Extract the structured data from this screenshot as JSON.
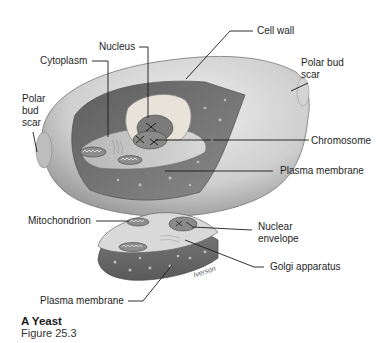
{
  "figure": {
    "title": "A Yeast",
    "subtitle": "Figure 25.3",
    "artist_signature": "Iverson"
  },
  "labels": {
    "nucleus": "Nucleus",
    "cytoplasm": "Cytoplasm",
    "cell_wall": "Cell wall",
    "polar_bud_scar_left_1": "Polar",
    "polar_bud_scar_left_2": "bud",
    "polar_bud_scar_left_3": "scar",
    "polar_bud_scar_right_1": "Polar bud",
    "polar_bud_scar_right_2": "scar",
    "chromosome": "Chromosome",
    "plasma_membrane_top": "Plasma membrane",
    "mitochondrion": "Mitochondrion",
    "nuclear_envelope_1": "Nuclear",
    "nuclear_envelope_2": "envelope",
    "golgi_apparatus": "Golgi apparatus",
    "plasma_membrane_bottom": "Plasma membrane"
  },
  "colors": {
    "cell_wall": "#c9c9c9",
    "cytoplasm_dark": "#6e6e6e",
    "interior": "#bdbdbd",
    "nucleus": "#7a7a7a",
    "leader_line": "#1a1a1a"
  }
}
